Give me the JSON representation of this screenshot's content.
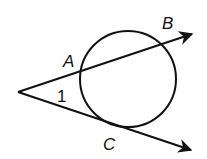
{
  "diagram": {
    "type": "geometry",
    "labels": {
      "A": "A",
      "B": "B",
      "C": "C",
      "angle": "1"
    },
    "colors": {
      "stroke": "#111111",
      "background": "#ffffff"
    },
    "circle": {
      "cx": 128,
      "cy": 79,
      "r": 48
    },
    "vertex": {
      "x": 18,
      "y": 92
    },
    "ray_upper_end": {
      "x": 193,
      "y": 34
    },
    "ray_lower_end": {
      "x": 192,
      "y": 150
    }
  }
}
